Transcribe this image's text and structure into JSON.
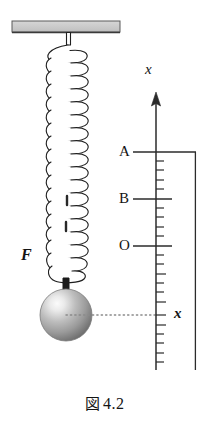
{
  "figure": {
    "caption_symbol": "図",
    "caption_number": "4.2",
    "caption_full": "図 4.2"
  },
  "diagram": {
    "ceiling": {
      "name": "ceiling-support",
      "fill_color": "#c9c9c9",
      "edge_color": "#4a4a4a"
    },
    "spring": {
      "name": "helical-spring",
      "coil_count": 17,
      "stroke_color": "#1f1f1f",
      "fill_color": "#ffffff"
    },
    "ball": {
      "name": "hanging-mass-ball",
      "highlight_color": "#f2f2f2",
      "mid_color": "#b0b0b0",
      "shadow_color": "#6e6e6e"
    },
    "force_label": "F",
    "dotted_leader": {
      "name": "ball-to-axis-leader",
      "color": "#808080"
    }
  },
  "axis": {
    "name": "vertical-x-axis",
    "arrow_label": "x",
    "axis_color": "#2b2b2b",
    "direction": "up",
    "major_ticks": [
      {
        "label": "A",
        "y": 152
      },
      {
        "label": "B",
        "y": 199
      },
      {
        "label": "O",
        "y": 246
      }
    ],
    "minor_tick_count": 22,
    "displacement_label": "x",
    "bracket": {
      "name": "displacement-bracket",
      "top_label": "A",
      "bottom_label": "x"
    }
  },
  "colors": {
    "ink": "#1a1a1a",
    "gray_fill": "#c9c9c9",
    "leader_gray": "#808080"
  }
}
